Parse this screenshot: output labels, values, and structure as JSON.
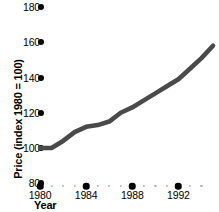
{
  "chart_data": {
    "type": "line",
    "title": "",
    "xlabel": "Year",
    "ylabel": "Price (index 1980 = 100)",
    "xlim": [
      1980,
      1995
    ],
    "ylim": [
      80,
      180
    ],
    "grid": false,
    "legend": null,
    "x_ticks": [
      "1980",
      "1984",
      "1988",
      "1992"
    ],
    "x_tick_values": [
      1980,
      1984,
      1988,
      1992
    ],
    "y_ticks": [
      "80",
      "100",
      "120",
      "140",
      "160",
      "180"
    ],
    "y_tick_values": [
      80,
      100,
      120,
      140,
      160,
      180
    ],
    "series": [
      {
        "name": "Price index",
        "color": "#4a4a4a",
        "x": [
          1980,
          1981,
          1982,
          1983,
          1984,
          1985,
          1986,
          1987,
          1988,
          1989,
          1990,
          1991,
          1992,
          1993,
          1994,
          1995
        ],
        "values": [
          100,
          100,
          104,
          109,
          112,
          113,
          115,
          120,
          123,
          127,
          131,
          135,
          139,
          145,
          151,
          158
        ]
      }
    ]
  },
  "axis": {
    "y_title": "Price (index 1980 = 100)",
    "x_title": "Year"
  },
  "style": {
    "line_color": "#4a4a4a",
    "tick_dot_color": "#000000",
    "minor_dot_color": "#b5b5b5",
    "text_color": "#000000",
    "background": "#ffffff"
  }
}
